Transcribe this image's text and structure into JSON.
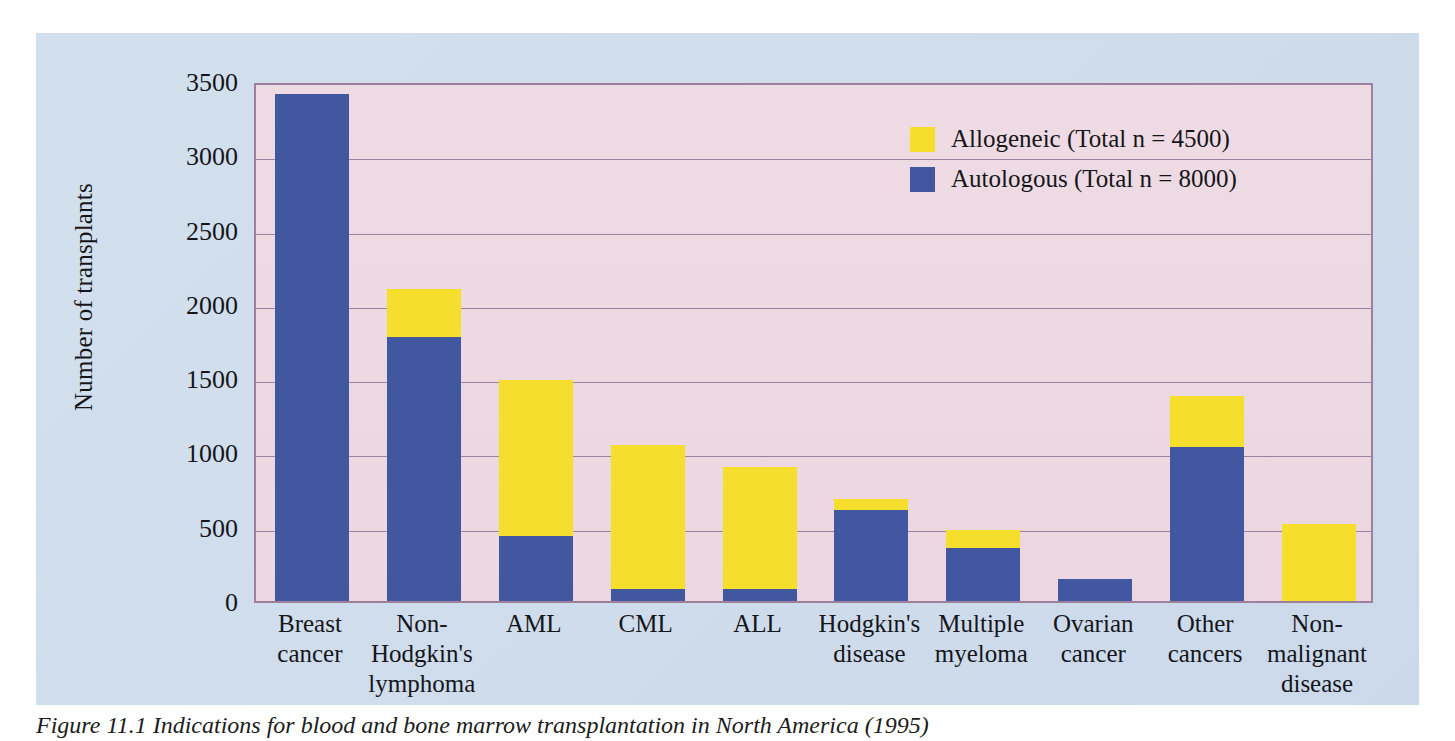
{
  "figure": {
    "caption": "Figure 11.1 Indications for blood and bone marrow transplantation in North America (1995)",
    "panel_color": "#cfdcec",
    "plot_bg_color": "#edd9e2",
    "axis_color": "#9d7f9e"
  },
  "legend": {
    "position": "top-right",
    "entries": [
      {
        "label": "Allogeneic (Total n = 4500)",
        "color": "#f5de2c",
        "swatch": "allogeneic-swatch"
      },
      {
        "label": "Autologous (Total n = 8000)",
        "color": "#41579f",
        "swatch": "autologous-swatch"
      }
    ]
  },
  "chart_data": {
    "type": "bar",
    "stacked": true,
    "title": "",
    "xlabel": "",
    "ylabel": "Number of transplants",
    "ylim": [
      0,
      3500
    ],
    "yticks": [
      0,
      500,
      1000,
      1500,
      2000,
      2500,
      3000,
      3500
    ],
    "ytick_labels": [
      "0",
      "500",
      "1000",
      "1500",
      "2000",
      "2500",
      "3000",
      "3500"
    ],
    "grid": true,
    "legend_position": "top-right",
    "categories": [
      "Breast cancer",
      "Non-Hodgkin's lymphoma",
      "AML",
      "CML",
      "ALL",
      "Hodgkin's disease",
      "Multiple myeloma",
      "Ovarian cancer",
      "Other cancers",
      "Non-malignant disease"
    ],
    "category_lines": [
      [
        "Breast",
        "cancer"
      ],
      [
        "Non-",
        "Hodgkin's",
        "lymphoma"
      ],
      [
        "AML"
      ],
      [
        "CML"
      ],
      [
        "ALL"
      ],
      [
        "Hodgkin's",
        "disease"
      ],
      [
        "Multiple",
        "myeloma"
      ],
      [
        "Ovarian",
        "cancer"
      ],
      [
        "Other",
        "cancers"
      ],
      [
        "Non-",
        "malignant",
        "disease"
      ]
    ],
    "series": [
      {
        "name": "Autologous (Total n = 8000)",
        "color": "#41579f",
        "values": [
          3410,
          1780,
          440,
          80,
          80,
          610,
          355,
          145,
          1040,
          0
        ]
      },
      {
        "name": "Allogeneic (Total n = 4500)",
        "color": "#f5de2c",
        "values": [
          0,
          320,
          1050,
          970,
          820,
          80,
          125,
          0,
          340,
          520
        ]
      }
    ],
    "totals": [
      3410,
      2100,
      1490,
      1050,
      900,
      690,
      480,
      145,
      1380,
      520
    ]
  }
}
